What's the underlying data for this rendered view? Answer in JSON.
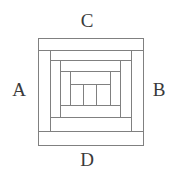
{
  "figure": {
    "kind": "nested-rectangles-diagram",
    "background_color": "#ffffff",
    "stroke_color": "#808080",
    "label_color": "#3a3a3a",
    "stroke_width": 1,
    "canvas": {
      "width": 174,
      "height": 177
    }
  },
  "labels": {
    "left": "A",
    "right": "B",
    "top": "C",
    "bottom": "D"
  },
  "chart_data": {
    "type": "diagram",
    "title": "",
    "xlabel": "",
    "ylabel": "",
    "frames": [
      {
        "name": "frame-outer",
        "x": 38,
        "y": 38,
        "width": 105,
        "height": 107
      },
      {
        "name": "frame-second",
        "x": 38,
        "y": 50,
        "width": 105,
        "height": 81
      },
      {
        "name": "frame-third",
        "x": 50,
        "y": 50,
        "width": 81,
        "height": 81
      },
      {
        "name": "frame-fourth",
        "x": 50,
        "y": 60,
        "width": 81,
        "height": 57
      },
      {
        "name": "frame-fifth",
        "x": 60,
        "y": 60,
        "width": 60,
        "height": 57
      },
      {
        "name": "frame-sixth",
        "x": 60,
        "y": 71,
        "width": 60,
        "height": 34
      },
      {
        "name": "frame-inner",
        "x": 70,
        "y": 71,
        "width": 40,
        "height": 34
      }
    ],
    "center_cells": {
      "name": "center-cell-row",
      "x": 70,
      "y": 84,
      "width": 40,
      "height": 21,
      "count": 3,
      "dividers_x": [
        83,
        96
      ]
    }
  }
}
